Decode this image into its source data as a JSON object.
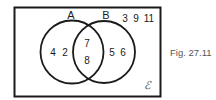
{
  "diagram": {
    "type": "venn",
    "universal_set_symbol": "ℰ",
    "sets": [
      {
        "name": "A",
        "label": "A"
      },
      {
        "name": "B",
        "label": "B"
      }
    ],
    "regions": {
      "A_only": [
        "4",
        "2"
      ],
      "A_and_B": [
        "7",
        "8"
      ],
      "B_only": [
        "5",
        "6"
      ],
      "outside": [
        "3",
        "9",
        "11"
      ]
    },
    "caption": "Fig. 27.11",
    "colors": {
      "stroke": "#1a1a1a",
      "caption": "#555555",
      "background": "#ffffff"
    }
  }
}
